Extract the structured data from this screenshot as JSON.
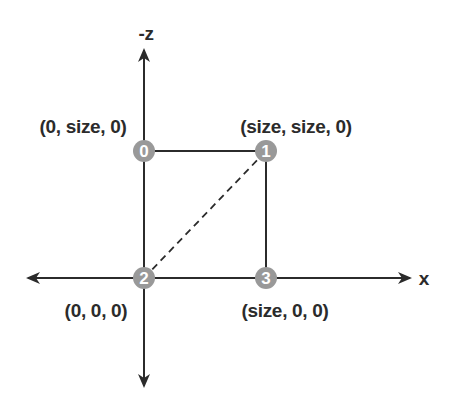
{
  "diagram": {
    "type": "coordinate-square-vertices",
    "axes": {
      "vertical_label": "-z",
      "horizontal_label": "x"
    },
    "vertices": [
      {
        "index": "0",
        "label": "(0, size, 0)",
        "x": 144,
        "y": 151
      },
      {
        "index": "1",
        "label": "(size, size, 0)",
        "x": 266,
        "y": 151
      },
      {
        "index": "2",
        "label": "(0, 0, 0)",
        "x": 144,
        "y": 278
      },
      {
        "index": "3",
        "label": "(size, 0, 0)",
        "x": 266,
        "y": 278
      }
    ],
    "edges": [
      {
        "from": "0",
        "to": "1",
        "style": "solid"
      },
      {
        "from": "1",
        "to": "3",
        "style": "solid"
      },
      {
        "from": "2",
        "to": "3",
        "style": "solid"
      },
      {
        "from": "0",
        "to": "2",
        "style": "solid"
      },
      {
        "from": "2",
        "to": "1",
        "style": "dashed"
      }
    ],
    "colors": {
      "line": "#2b2b2b",
      "node_fill": "#999999",
      "node_text": "#ffffff",
      "label_text": "#2b2b2b"
    }
  }
}
